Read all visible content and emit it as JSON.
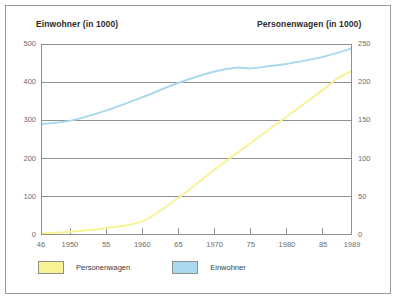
{
  "figure": {
    "left_axis_title": "Einwohner (in 1000)",
    "right_axis_title": "Personenwagen (in 1000)"
  },
  "legend": {
    "entries": [
      {
        "label": "Personenwagen",
        "color": "#f7f294",
        "name": "legend-swatch-personenwagen"
      },
      {
        "label": "Einwohner",
        "color": "#a9d9ee",
        "name": "legend-swatch-einwohner"
      }
    ]
  },
  "chart_data": {
    "type": "line",
    "title": "",
    "xlabel": "",
    "grid": true,
    "legend_position": "bottom-left",
    "xlim": [
      1946,
      1989
    ],
    "x_tick_values": [
      1946,
      1950,
      1955,
      1960,
      1965,
      1970,
      1975,
      1980,
      1985,
      1989
    ],
    "x_tick_labels": [
      "46",
      "1950",
      "55",
      "1960",
      "65",
      "1970",
      "75",
      "1980",
      "85",
      "1989"
    ],
    "left_axis": {
      "label": "Einwohner (in 1000)",
      "ylim": [
        0,
        500
      ],
      "ticks": [
        0,
        100,
        200,
        300,
        400,
        500
      ],
      "tick_labels": [
        "0",
        "100",
        "200",
        "300",
        "400",
        "500"
      ]
    },
    "right_axis": {
      "label": "Personenwagen (in 1000)",
      "ylim": [
        0,
        250
      ],
      "ticks": [
        0,
        50,
        100,
        150,
        200,
        250
      ],
      "tick_labels": [
        "0",
        "50",
        "100",
        "150",
        "200",
        "250"
      ]
    },
    "series": [
      {
        "name": "Einwohner",
        "color": "#a9d9ee",
        "axis": "left",
        "unit": "in 1000",
        "x": [
          1946,
          1950,
          1955,
          1960,
          1965,
          1970,
          1973,
          1975,
          1978,
          1980,
          1985,
          1989
        ],
        "values": [
          291,
          300,
          327,
          362,
          400,
          430,
          440,
          438,
          445,
          450,
          468,
          490
        ]
      },
      {
        "name": "Personenwagen",
        "color": "#f7f294",
        "axis": "right",
        "unit": "in 1000",
        "x": [
          1946,
          1950,
          1955,
          1960,
          1965,
          1970,
          1975,
          1980,
          1985,
          1987,
          1989
        ],
        "values": [
          1,
          3,
          8,
          17,
          48,
          85,
          120,
          155,
          190,
          205,
          215
        ]
      }
    ]
  }
}
